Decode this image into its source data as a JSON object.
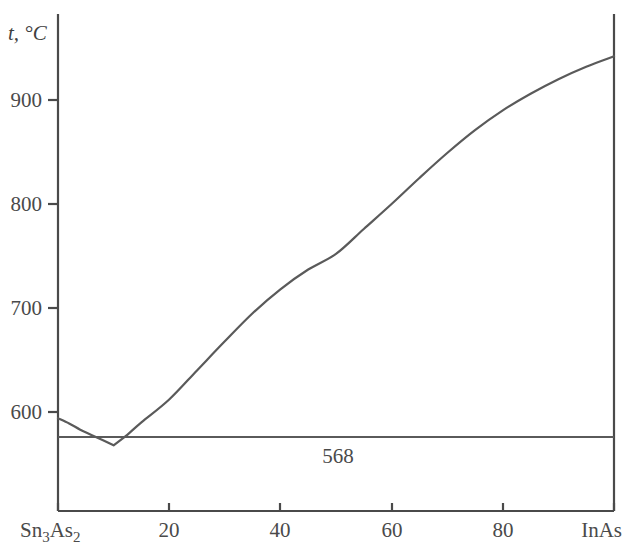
{
  "chart_data": {
    "type": "line",
    "title": "",
    "xlabel": "",
    "ylabel": "t, °C",
    "xlim": [
      0,
      100
    ],
    "ylim": [
      500,
      960
    ],
    "grid": false,
    "legend": null,
    "x_axis": {
      "left_endpoint_label": "Sn3As2",
      "right_endpoint_label": "InAs",
      "tick_values": [
        20,
        40,
        60,
        80
      ],
      "tick_labels": [
        "20",
        "40",
        "60",
        "80"
      ],
      "boundary_ticks": [
        0,
        100
      ]
    },
    "y_axis": {
      "tick_values": [
        600,
        700,
        800,
        900
      ],
      "tick_labels": [
        "600",
        "700",
        "800",
        "900"
      ]
    },
    "series": [
      {
        "name": "liquidus",
        "x": [
          0,
          2,
          4,
          6,
          8,
          10,
          12,
          15,
          20,
          25,
          30,
          35,
          40,
          45,
          50,
          55,
          60,
          65,
          70,
          75,
          80,
          85,
          90,
          95,
          100
        ],
        "values": [
          594,
          589,
          583,
          578,
          573,
          568,
          576,
          590,
          612,
          640,
          668,
          695,
          718,
          737,
          752,
          776,
          800,
          825,
          849,
          871,
          890,
          906,
          920,
          932,
          942
        ]
      },
      {
        "name": "eutectic-horizontal",
        "x": [
          0,
          100
        ],
        "values": [
          568,
          568
        ]
      }
    ],
    "annotations": [
      {
        "text": "568",
        "x": 45,
        "y": 551,
        "name": "eutectic-temperature-label"
      }
    ],
    "eutectic_point": {
      "x": 10,
      "t": 568
    },
    "colors": {
      "curve": "#5a5a5a",
      "axis": "#4a4a4a",
      "background": "#ffffff"
    }
  }
}
